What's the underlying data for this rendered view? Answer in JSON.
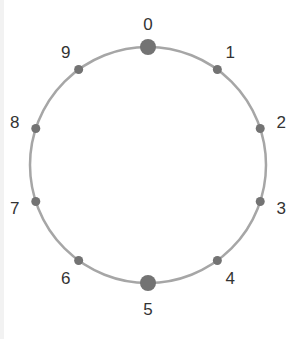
{
  "diagram": {
    "type": "ring",
    "center": [
      148,
      165
    ],
    "radius": 118,
    "ring_color": "#a6a6a6",
    "dot_color": "#737373",
    "nodes": [
      {
        "label": "0",
        "large": true
      },
      {
        "label": "1",
        "large": false
      },
      {
        "label": "2",
        "large": false
      },
      {
        "label": "3",
        "large": false
      },
      {
        "label": "4",
        "large": false
      },
      {
        "label": "5",
        "large": true
      },
      {
        "label": "6",
        "large": false
      },
      {
        "label": "7",
        "large": false
      },
      {
        "label": "8",
        "large": false
      },
      {
        "label": "9",
        "large": false
      }
    ]
  }
}
